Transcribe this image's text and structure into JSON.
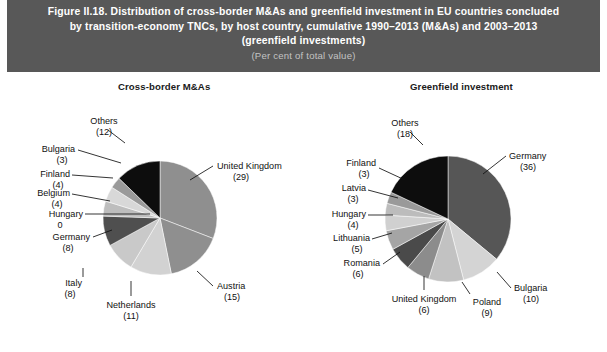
{
  "header": {
    "title_line1": "Figure II.18. Distribution of cross-border M&As and greenfield investment in EU countries concluded",
    "title_line2": "by transition-economy TNCs, by host country, cumulative 1990–2013 (M&As) and 2003–2013",
    "title_line3": "(greenfield investments)",
    "subtitle": "(Per cent of total value)",
    "bg_color": "#585858",
    "title_color": "#ffffff",
    "subtitle_color": "#c3c3c3"
  },
  "panels": {
    "left_title": "Cross-border M&As",
    "right_title": "Greenfield investment"
  },
  "chart_data": [
    {
      "type": "pie",
      "title": "Cross-border M&As",
      "unit": "Per cent of total value",
      "labels": [
        "United Kingdom",
        "Austria",
        "Netherlands",
        "Italy",
        "Germany",
        "Hungary",
        "Belgium",
        "Finland",
        "Bulgaria",
        "Others"
      ],
      "values": [
        29,
        15,
        11,
        8,
        8,
        0,
        4,
        4,
        3,
        12
      ],
      "value_labels": [
        "(29)",
        "(15)",
        "(11)",
        "(8)",
        "(8)",
        "0",
        "(4)",
        "(4)",
        "(3)",
        "(12)"
      ],
      "colors": [
        "#8f8f8f",
        "#8f8f8f",
        "#d2d2d2",
        "#c9c9c9",
        "#4f4f4f",
        "#9b9b9b",
        "#bdbdbd",
        "#d8d8d8",
        "#9a9a9a",
        "#0d0d0d"
      ],
      "start_angle": 0,
      "direction": "clockwise"
    },
    {
      "type": "pie",
      "title": "Greenfield investment",
      "unit": "Per cent of total value",
      "labels": [
        "Germany",
        "Bulgaria",
        "Poland",
        "United Kingdom",
        "Romania",
        "Lithuania",
        "Hungary",
        "Latvia",
        "Finland",
        "Others"
      ],
      "values": [
        36,
        10,
        9,
        6,
        6,
        5,
        4,
        3,
        3,
        18
      ],
      "value_labels": [
        "(36)",
        "(10)",
        "(9)",
        "(6)",
        "(6)",
        "(5)",
        "(4)",
        "(3)",
        "(3)",
        "(18)"
      ],
      "colors": [
        "#565656",
        "#d4d4d4",
        "#c2c2c2",
        "#8c8c8c",
        "#4a4a4a",
        "#a5a5a5",
        "#d0d0d0",
        "#bcbcbc",
        "#9a9a9a",
        "#0d0d0d"
      ],
      "start_angle": 0,
      "direction": "clockwise"
    }
  ],
  "left_labels": {
    "others": "Others",
    "others_v": "(12)",
    "bulgaria": "Bulgaria",
    "bulgaria_v": "(3)",
    "finland": "Finland",
    "finland_v": "(4)",
    "belgium": "Belgium",
    "belgium_v": "(4)",
    "hungary": "Hungary",
    "hungary_v": "0",
    "germany": "Germany",
    "germany_v": "(8)",
    "italy": "Italy",
    "italy_v": "(8)",
    "netherlands": "Netherlands",
    "netherlands_v": "(11)",
    "austria": "Austria",
    "austria_v": "(15)",
    "uk": "United Kingdom",
    "uk_v": "(29)"
  },
  "right_labels": {
    "others": "Others",
    "others_v": "(18)",
    "finland": "Finland",
    "finland_v": "(3)",
    "latvia": "Latvia",
    "latvia_v": "(3)",
    "hungary": "Hungary",
    "hungary_v": "(4)",
    "lithuania": "Lithuania",
    "lithuania_v": "(5)",
    "romania": "Romania",
    "romania_v": "(6)",
    "uk": "United Kingdom",
    "uk_v": "(6)",
    "poland": "Poland",
    "poland_v": "(9)",
    "bulgaria": "Bulgaria",
    "bulgaria_v": "(10)",
    "germany": "Germany",
    "germany_v": "(36)"
  }
}
